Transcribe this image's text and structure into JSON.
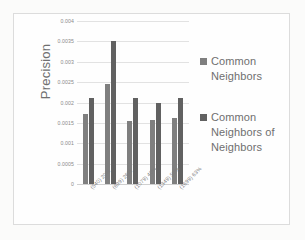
{
  "chart_data": {
    "type": "bar",
    "title": "",
    "xlabel": "",
    "ylabel": "Precision",
    "categories": [
      "(540) 20%",
      "(699) 26%",
      "(1079) 40%",
      "(1349) 50%",
      "(1699) 63%"
    ],
    "series": [
      {
        "name": "Common Neighbors",
        "values": [
          0.00172,
          0.00246,
          0.00155,
          0.00158,
          0.00163
        ],
        "color": "#7f7f7f"
      },
      {
        "name": "Common Neighbors of Neighbors",
        "values": [
          0.0021,
          0.0035,
          0.0021,
          0.002,
          0.0021
        ],
        "color": "#616161"
      }
    ],
    "ylim": [
      0,
      0.004
    ],
    "ytick_labels": [
      "0.004",
      "0.0035",
      "0.003",
      "0.0025",
      "0.002",
      "0.0015",
      "0.001",
      "0.0005",
      "0"
    ],
    "ytick_values": [
      0.004,
      0.0035,
      0.003,
      0.0025,
      0.002,
      0.0015,
      0.001,
      0.0005,
      0
    ],
    "grid": true,
    "legend_position": "right"
  }
}
